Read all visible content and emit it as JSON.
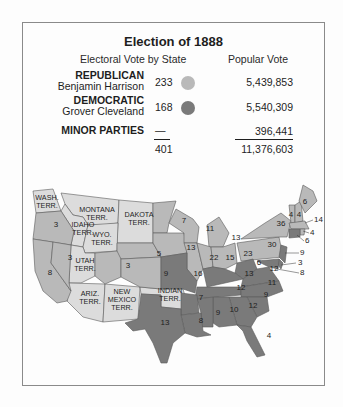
{
  "title": "Election of 1888",
  "headers": {
    "electoral": "Electoral Vote by State",
    "popular": "Popular Vote"
  },
  "colors": {
    "republican": "#b9b9b9",
    "democratic": "#7a7a7a",
    "territory": "#dcdcdc",
    "border": "#5a5a5a"
  },
  "parties": [
    {
      "party": "REPUBLICAN",
      "candidate": "Benjamin Harrison",
      "electoral": "233",
      "popular": "5,439,853"
    },
    {
      "party": "DEMOCRATIC",
      "candidate": "Grover Cleveland",
      "electoral": "168",
      "popular": "5,540,309"
    },
    {
      "party": "MINOR PARTIES",
      "candidate": "",
      "electoral": "—",
      "popular": "396,441"
    }
  ],
  "totals": {
    "electoral": "401",
    "popular": "11,376,603"
  },
  "map": {
    "territories": [
      {
        "name": "wash",
        "l1": "WASH.",
        "l2": "TERR."
      },
      {
        "name": "montana",
        "l1": "MONTANA",
        "l2": "TERR."
      },
      {
        "name": "dakota",
        "l1": "DAKOTA",
        "l2": "TERR."
      },
      {
        "name": "idaho",
        "l1": "IDAHO",
        "l2": "TERR."
      },
      {
        "name": "wyo",
        "l1": "WYO.",
        "l2": "TERR."
      },
      {
        "name": "utah",
        "l1": "UTAH",
        "l2": "TERR."
      },
      {
        "name": "ariz",
        "l1": "ARIZ.",
        "l2": "TERR."
      },
      {
        "name": "newmexico",
        "l1": "NEW",
        "l2": "MEXICO",
        "l3": "TERR."
      },
      {
        "name": "indian",
        "l1": "INDIAN",
        "l2": "TERR."
      }
    ],
    "states": {
      "oregon": "3",
      "california": "8",
      "nevada": "3",
      "colorado": "3",
      "nebraska": "5",
      "kansas": "9",
      "minnesota": "7",
      "iowa": "13",
      "wisconsin": "11",
      "michigan": "13",
      "illinois": "22",
      "indiana": "15",
      "ohio": "23",
      "missouri": "16",
      "texas": "13",
      "arkansas": "7",
      "louisiana": "8",
      "mississippi": "9",
      "alabama": "10",
      "georgia": "12",
      "florida": "4",
      "tennessee": "12",
      "kentucky": "13",
      "westvirginia": "6",
      "virginia": "12",
      "northcarolina": "11",
      "southcarolina": "9",
      "pennsylvania": "30",
      "newyork": "36",
      "maine": "6",
      "vermont": "4",
      "newhampshire": "4",
      "massachusetts": "14",
      "rhodeisland": "4",
      "connecticut": "6",
      "newjersey": "9",
      "delaware": "3",
      "maryland": "8"
    }
  }
}
